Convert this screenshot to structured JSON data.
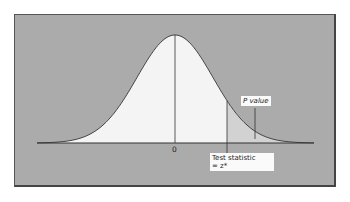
{
  "chart_data": {
    "type": "area",
    "title": "",
    "x_center_label": "0",
    "test_statistic_label": "Test statistic",
    "test_statistic_value": "= z*",
    "p_value_label": "P value",
    "shaded_region": "right tail beyond z*"
  },
  "labels": {
    "zero": "0",
    "test_stat_line1": "Test statistic",
    "test_stat_line2": "= z*",
    "p_value": "P value"
  },
  "colors": {
    "background": "#ababab",
    "curve_fill": "#f4f4f4",
    "tail_fill": "#d2d2d2",
    "line": "#333333"
  }
}
